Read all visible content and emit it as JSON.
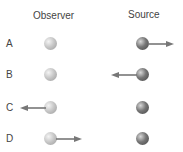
{
  "headers": {
    "observer": "Observer",
    "source": "Source"
  },
  "rows": [
    {
      "label": "A",
      "observer_arrow": "none",
      "source_arrow": "right"
    },
    {
      "label": "B",
      "observer_arrow": "none",
      "source_arrow": "left"
    },
    {
      "label": "C",
      "observer_arrow": "left",
      "source_arrow": "none"
    },
    {
      "label": "D",
      "observer_arrow": "right",
      "source_arrow": "none"
    }
  ],
  "colors": {
    "arrow": "#777777",
    "observer_ball": "#c8c8c8",
    "source_ball": "#666666"
  }
}
